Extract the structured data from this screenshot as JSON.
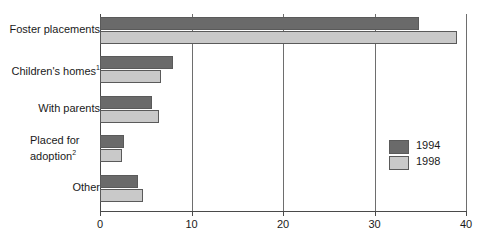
{
  "chart_data": {
    "type": "bar",
    "orientation": "horizontal",
    "title": "",
    "xlabel": "",
    "ylabel": "",
    "xlim": [
      0,
      40
    ],
    "xticks": [
      0,
      10,
      20,
      30,
      40
    ],
    "xtick_labels": [
      "0",
      "10",
      "20",
      "30",
      "40"
    ],
    "grid": true,
    "legend_position": "inside-right",
    "categories": [
      "Foster placements",
      "Children's homes",
      "With parents",
      "Placed for adoption",
      "Other"
    ],
    "category_footnotes": [
      "",
      "1",
      "",
      "2",
      ""
    ],
    "series": [
      {
        "name": "1994",
        "color": "#6a6a6a",
        "values": [
          34.9,
          8.0,
          5.7,
          2.6,
          4.2
        ]
      },
      {
        "name": "1998",
        "color": "#c9c9c9",
        "values": [
          39.0,
          6.7,
          6.5,
          2.4,
          4.7
        ]
      }
    ]
  },
  "legend": {
    "entries": [
      {
        "label": "1994"
      },
      {
        "label": "1998"
      }
    ]
  },
  "clipped_header_text": ""
}
